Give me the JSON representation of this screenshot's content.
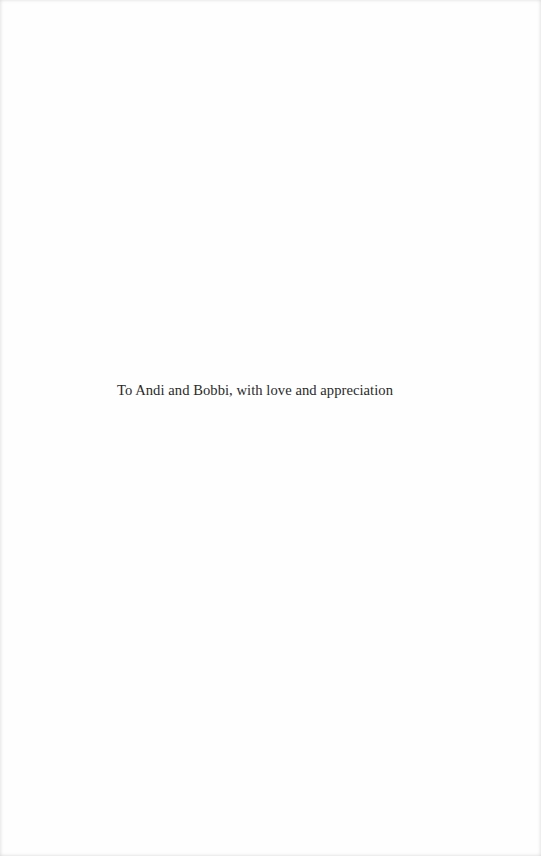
{
  "page": {
    "type": "dedication",
    "dedication_text": "To Andi and Bobbi, with love and appreciation"
  },
  "colors": {
    "background": "#fefefe",
    "text": "#2a2a2a"
  }
}
